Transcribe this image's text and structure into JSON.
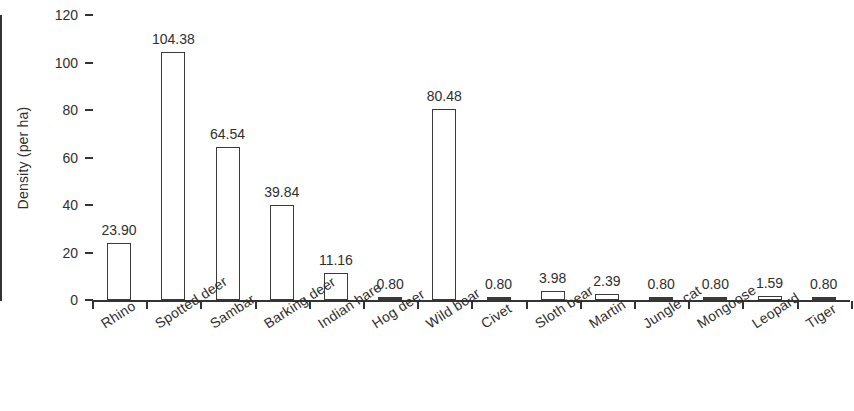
{
  "chart_data": {
    "type": "bar",
    "title": "",
    "xlabel": "",
    "ylabel": "Density (per ha)",
    "ylim": [
      0,
      120
    ],
    "yticks": [
      0,
      20,
      40,
      60,
      80,
      100,
      120
    ],
    "grid": false,
    "legend": "none",
    "orientation": "vertical",
    "bar_style": "outlined-white-fill",
    "label_rotation_deg": -33,
    "categories": [
      "Rhino",
      "Spotted deer",
      "Sambar",
      "Barking deer",
      "Indian hare",
      "Hog deer",
      "Wild boar",
      "Civet",
      "Sloth bear",
      "Martin",
      "Jungle cat",
      "Mongoose",
      "Leopard",
      "Tiger"
    ],
    "values": [
      23.9,
      104.38,
      64.54,
      39.84,
      11.16,
      0.8,
      80.48,
      0.8,
      3.98,
      2.39,
      0.8,
      0.8,
      1.59,
      0.8
    ],
    "value_labels": [
      "23.90",
      "104.38",
      "64.54",
      "39.84",
      "11.16",
      "0.80",
      "80.48",
      "0.80",
      "3.98",
      "2.39",
      "0.80",
      "0.80",
      "1.59",
      "0.80"
    ]
  },
  "colors": {
    "axis": "#333333",
    "bar_outline": "#3a3a3a",
    "bar_fill": "#ffffff",
    "text": "#2f2f2f",
    "background": "#ffffff"
  }
}
